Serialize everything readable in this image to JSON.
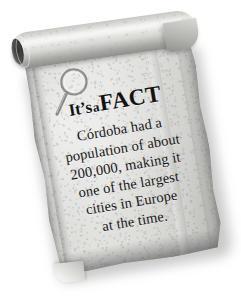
{
  "card": {
    "type": "parchment-scroll-fact-card",
    "headline": {
      "part1": "It’s",
      "part2": "a",
      "part3": "FACT"
    },
    "icon": "magnifying-glass-icon",
    "body_lines": [
      "Córdoba had a",
      "population of about",
      "200,000, making it",
      "one of the largest",
      "cities in Europe",
      "at the time."
    ],
    "body_full": "Córdoba had a population of about 200,000, making it one of the largest cities in Europe at the time.",
    "colors": {
      "background": "#ffffff",
      "parchment_light": "#e2e2df",
      "parchment_mid": "#d2d2cf",
      "parchment_dark": "#a4a4a1",
      "text": "#121212",
      "shadow": "#787876"
    },
    "rotation_degrees": -9.5
  }
}
